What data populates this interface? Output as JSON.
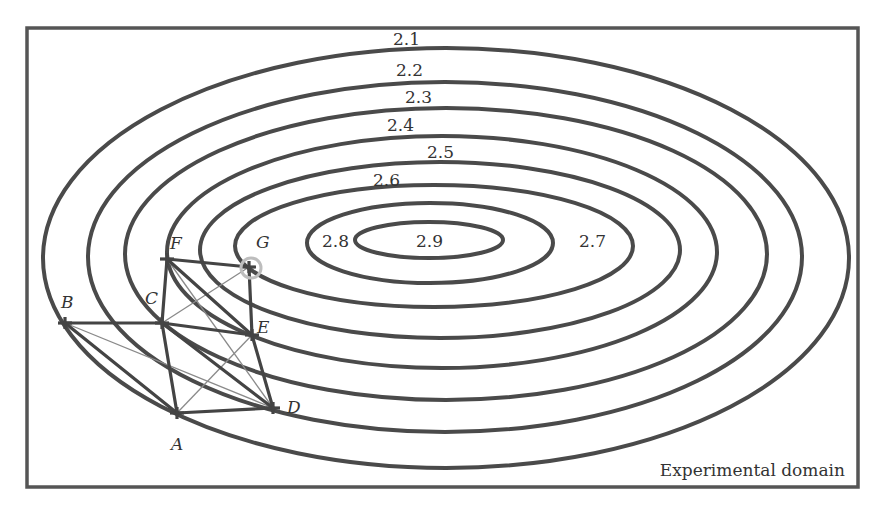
{
  "figure": {
    "domain_label": "Experimental domain",
    "frame": {
      "x": 27,
      "y": 28,
      "width": 831,
      "height": 459
    },
    "colors": {
      "line": "#444444",
      "thin_line": "#8a8a8a",
      "optimum_circle": "#bdbdbd",
      "background": "#ffffff"
    }
  },
  "contours": [
    {
      "cx": 446,
      "cy": 258,
      "rx": 403,
      "ry": 210
    },
    {
      "cx": 445,
      "cy": 257,
      "rx": 357,
      "ry": 175
    },
    {
      "cx": 446,
      "cy": 254,
      "rx": 321,
      "ry": 146
    },
    {
      "cx": 442,
      "cy": 252,
      "rx": 275,
      "ry": 116
    },
    {
      "cx": 440,
      "cy": 250,
      "rx": 240,
      "ry": 88
    },
    {
      "cx": 434,
      "cy": 246,
      "rx": 199,
      "ry": 61
    },
    {
      "cx": 430,
      "cy": 243,
      "rx": 123,
      "ry": 40
    },
    {
      "cx": 429,
      "cy": 240,
      "rx": 74,
      "ry": 18
    }
  ],
  "contour_labels": [
    {
      "text": "2.1",
      "x": 393,
      "y": 45
    },
    {
      "text": "2.2",
      "x": 396,
      "y": 76
    },
    {
      "text": "2.3",
      "x": 405,
      "y": 103
    },
    {
      "text": "2.4",
      "x": 387,
      "y": 131
    },
    {
      "text": "2.5",
      "x": 427,
      "y": 158
    },
    {
      "text": "2.6",
      "x": 373,
      "y": 186
    },
    {
      "text": "2.8",
      "x": 322,
      "y": 247
    },
    {
      "text": "2.9",
      "x": 416,
      "y": 247
    },
    {
      "text": "2.7",
      "x": 579,
      "y": 247
    }
  ],
  "points": {
    "A": {
      "x": 177,
      "y": 413,
      "lx": 171,
      "ly": 450
    },
    "B": {
      "x": 65,
      "y": 323,
      "lx": 61,
      "ly": 308
    },
    "C": {
      "x": 162,
      "y": 323,
      "lx": 145,
      "ly": 304
    },
    "D": {
      "x": 273,
      "y": 408,
      "lx": 287,
      "ly": 413
    },
    "E": {
      "x": 252,
      "y": 335,
      "lx": 257,
      "ly": 333
    },
    "F": {
      "x": 167,
      "y": 259,
      "lx": 170,
      "ly": 249
    },
    "G": {
      "x": 249,
      "y": 267,
      "lx": 256,
      "ly": 248
    }
  },
  "optimum_marker": {
    "point": "G",
    "r": 10
  },
  "thick_edges": [
    [
      "B",
      "C"
    ],
    [
      "B",
      "A"
    ],
    [
      "C",
      "A"
    ],
    [
      "A",
      "D"
    ],
    [
      "C",
      "D"
    ],
    [
      "C",
      "E"
    ],
    [
      "E",
      "D"
    ],
    [
      "F",
      "C"
    ],
    [
      "F",
      "E"
    ],
    [
      "F",
      "G"
    ],
    [
      "G",
      "E"
    ]
  ],
  "thin_edges": [
    [
      "B",
      "D"
    ],
    [
      "C",
      "G"
    ],
    [
      "A",
      "E"
    ],
    [
      "F",
      "D"
    ]
  ],
  "chart_data": {
    "type": "contour",
    "title": "",
    "contour_levels": [
      2.1,
      2.2,
      2.3,
      2.4,
      2.5,
      2.6,
      2.7,
      2.8,
      2.9
    ],
    "optimum_region": "2.9",
    "simplex_vertices": [
      "A",
      "B",
      "C",
      "D",
      "E",
      "F",
      "G"
    ],
    "annotation": "Experimental domain",
    "highlighted_vertex": "G"
  }
}
